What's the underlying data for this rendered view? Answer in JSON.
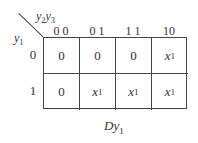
{
  "kmap": {
    "row_var": "y",
    "row_var_sub": "1",
    "col_var_1": "y",
    "col_var_1_sub": "2",
    "col_var_2": "y",
    "col_var_2_sub": "3",
    "col_headers": [
      "0 0",
      "0 1",
      "1 1",
      "10"
    ],
    "row_headers": [
      "0",
      "1"
    ],
    "cells": [
      [
        {
          "v": "0",
          "sub": ""
        },
        {
          "v": "0",
          "sub": ""
        },
        {
          "v": "0",
          "sub": ""
        },
        {
          "v": "x",
          "sub": "1"
        }
      ],
      [
        {
          "v": "0",
          "sub": ""
        },
        {
          "v": "x",
          "sub": "1"
        },
        {
          "v": "x",
          "sub": "1"
        },
        {
          "v": "x",
          "sub": "1"
        }
      ]
    ],
    "caption": "Dy",
    "caption_sub": "1"
  }
}
